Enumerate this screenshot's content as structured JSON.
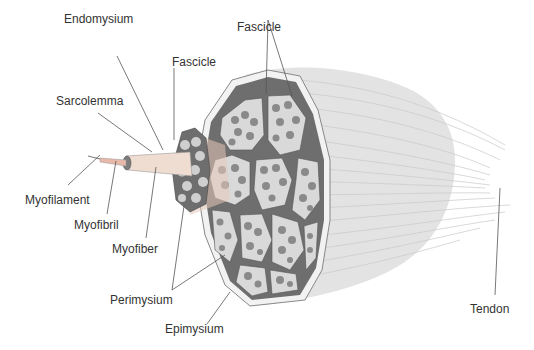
{
  "diagram": {
    "labels": {
      "endomysium": "Endomysium",
      "fascicle_small": "Fascicle",
      "fascicle_large": "Fascicle",
      "sarcolemma": "Sarcolemma",
      "myofilament": "Myofilament",
      "myofibril": "Myofibril",
      "myofiber": "Myofiber",
      "perimysium": "Perimysium",
      "epimysium": "Epimysium",
      "tendon": "Tendon"
    },
    "colors": {
      "muscle_body": "#e3e3e3",
      "epimysium_band": "#6e6e6e",
      "fascicle_fill": "#d9d9d9",
      "fiber_fill": "#8a8a8a",
      "leader_line": "#555555",
      "text": "#333333"
    }
  }
}
